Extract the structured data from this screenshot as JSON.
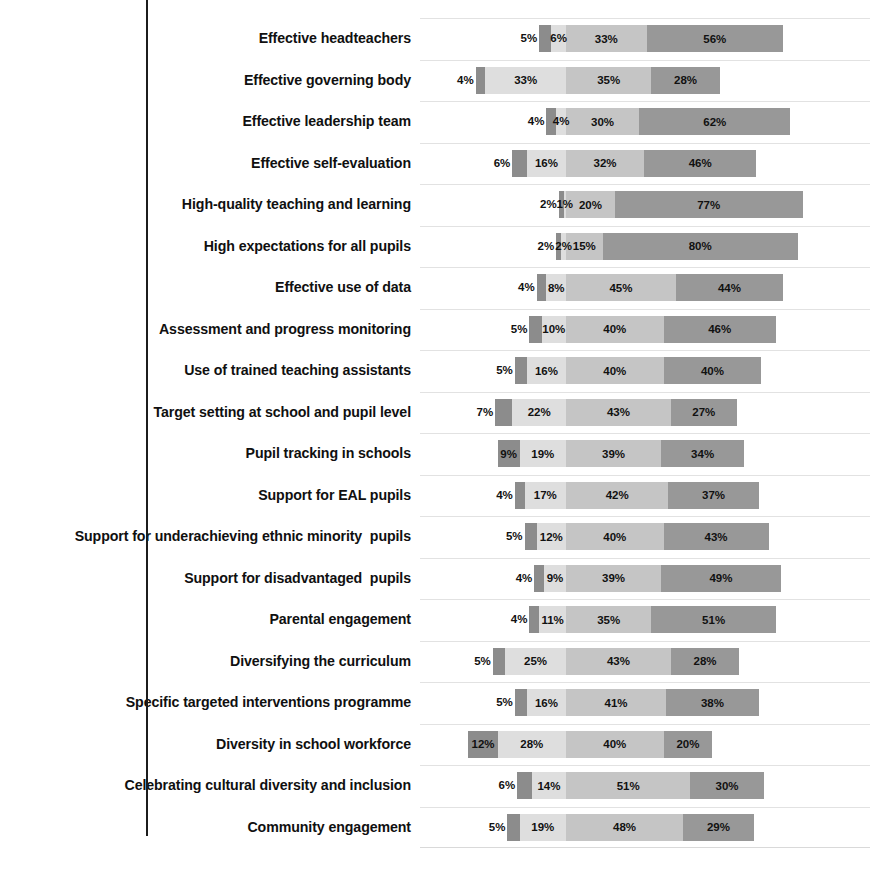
{
  "chart_data": {
    "type": "bar",
    "subtype": "diverging-stacked-bar",
    "title": "",
    "subtitle": "",
    "xlabel": "",
    "ylabel": "",
    "orientation": "horizontal",
    "stacked": true,
    "grid": true,
    "legend": null,
    "legend_position": "none",
    "value_suffix": "%",
    "axis_origin_percent": 40,
    "xlim": [
      0,
      100
    ],
    "series": [
      {
        "name": "segment-1",
        "color": "#8c8c8c"
      },
      {
        "name": "segment-2",
        "color": "#dedede"
      },
      {
        "name": "segment-3",
        "color": "#c5c5c5"
      },
      {
        "name": "segment-4",
        "color": "#989898"
      }
    ],
    "categories": [
      "Effective headteachers",
      "Effective governing body",
      "Effective leadership team",
      "Effective self-evaluation",
      "High-quality teaching and learning",
      "High expectations for all pupils",
      "Effective use of data",
      "Assessment and progress monitoring",
      "Use of trained teaching assistants",
      "Target setting at school and pupil level",
      "Pupil tracking in schools",
      "Support for EAL pupils",
      "Support for underachieving ethnic minority  pupils",
      "Support for disadvantaged  pupils",
      "Parental engagement",
      "Diversifying the curriculum",
      "Specific targeted interventions programme",
      "Diversity in school workforce",
      "Celebrating cultural diversity and inclusion",
      "Community engagement"
    ],
    "rows": [
      {
        "label": "Effective headteachers",
        "values": [
          5,
          6,
          33,
          56
        ],
        "labels": [
          "5%",
          "6%",
          "33%",
          "56%"
        ]
      },
      {
        "label": "Effective governing body",
        "values": [
          4,
          33,
          35,
          28
        ],
        "labels": [
          "4%",
          "33%",
          "35%",
          "28%"
        ]
      },
      {
        "label": "Effective leadership team",
        "values": [
          4,
          4,
          30,
          62
        ],
        "labels": [
          "4%",
          "4%",
          "30%",
          "62%"
        ]
      },
      {
        "label": "Effective self-evaluation",
        "values": [
          6,
          16,
          32,
          46
        ],
        "labels": [
          "6%",
          "16%",
          "32%",
          "46%"
        ]
      },
      {
        "label": "High-quality teaching and learning",
        "values": [
          2,
          1,
          20,
          77
        ],
        "labels": [
          "2%",
          "1%",
          "20%",
          "77%"
        ]
      },
      {
        "label": "High expectations for all pupils",
        "values": [
          2,
          2,
          15,
          80
        ],
        "labels": [
          "2%",
          "2%",
          "15%",
          "80%"
        ]
      },
      {
        "label": "Effective use of data",
        "values": [
          4,
          8,
          45,
          44
        ],
        "labels": [
          "4%",
          "8%",
          "45%",
          "44%"
        ]
      },
      {
        "label": "Assessment and progress monitoring",
        "values": [
          5,
          10,
          40,
          46
        ],
        "labels": [
          "5%",
          "10%",
          "40%",
          "46%"
        ]
      },
      {
        "label": "Use of trained teaching assistants",
        "values": [
          5,
          16,
          40,
          40
        ],
        "labels": [
          "5%",
          "16%",
          "40%",
          "40%"
        ]
      },
      {
        "label": "Target setting at school and pupil level",
        "values": [
          7,
          22,
          43,
          27
        ],
        "labels": [
          "7%",
          "22%",
          "43%",
          "27%"
        ]
      },
      {
        "label": "Pupil tracking in schools",
        "values": [
          9,
          19,
          39,
          34
        ],
        "labels": [
          "9%",
          "19%",
          "39%",
          "34%"
        ]
      },
      {
        "label": "Support for EAL pupils",
        "values": [
          4,
          17,
          42,
          37
        ],
        "labels": [
          "4%",
          "17%",
          "42%",
          "37%"
        ]
      },
      {
        "label": "Support for underachieving ethnic minority  pupils",
        "values": [
          5,
          12,
          40,
          43
        ],
        "labels": [
          "5%",
          "12%",
          "40%",
          "43%"
        ]
      },
      {
        "label": "Support for disadvantaged  pupils",
        "values": [
          4,
          9,
          39,
          49
        ],
        "labels": [
          "4%",
          "9%",
          "39%",
          "49%"
        ]
      },
      {
        "label": "Parental engagement",
        "values": [
          4,
          11,
          35,
          51
        ],
        "labels": [
          "4%",
          "11%",
          "35%",
          "51%"
        ]
      },
      {
        "label": "Diversifying the curriculum",
        "values": [
          5,
          25,
          43,
          28
        ],
        "labels": [
          "5%",
          "25%",
          "43%",
          "28%"
        ]
      },
      {
        "label": "Specific targeted interventions programme",
        "values": [
          5,
          16,
          41,
          38
        ],
        "labels": [
          "5%",
          "16%",
          "41%",
          "38%"
        ]
      },
      {
        "label": "Diversity in school workforce",
        "values": [
          12,
          28,
          40,
          20
        ],
        "labels": [
          "12%",
          "28%",
          "40%",
          "20%"
        ]
      },
      {
        "label": "Celebrating cultural diversity and inclusion",
        "values": [
          6,
          14,
          51,
          30
        ],
        "labels": [
          "6%",
          "14%",
          "51%",
          "30%"
        ]
      },
      {
        "label": "Community engagement",
        "values": [
          5,
          19,
          48,
          29
        ],
        "labels": [
          "5%",
          "19%",
          "48%",
          "29%"
        ]
      }
    ]
  }
}
